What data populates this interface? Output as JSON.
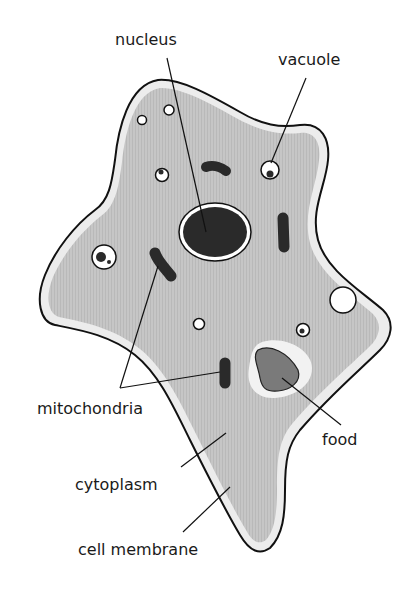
{
  "diagram": {
    "colors": {
      "cytoplasm": "#c4c4c4",
      "membrane_halo": "#eeeeee",
      "outline": "#111111",
      "organelle_dark": "#2a2a2a",
      "food": "#7a7a7a",
      "food_vacuole": "#f2f2f2",
      "vacuole": "#ffffff"
    },
    "labels": {
      "nucleus": "nucleus",
      "vacuole": "vacuole",
      "mitochondria": "mitochondria",
      "food": "food",
      "cytoplasm": "cytoplasm",
      "cell_membrane": "cell membrane"
    }
  }
}
